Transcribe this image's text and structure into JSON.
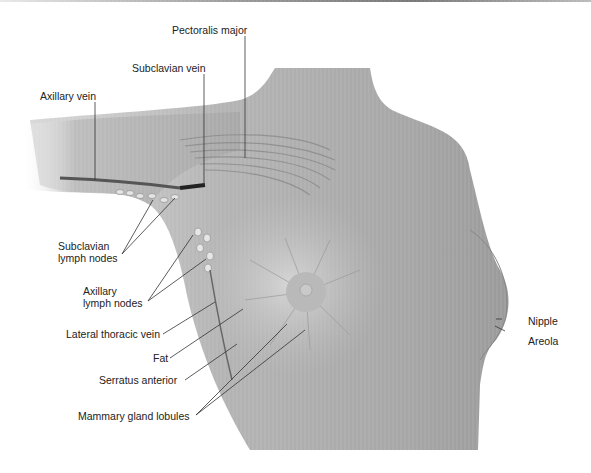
{
  "figure": {
    "labels": {
      "pectoralis_major": "Pectoralis major",
      "subclavian_vein": "Subclavian vein",
      "axillary_vein": "Axillary vein",
      "subclavian_lymph_nodes_1": "Subclavian",
      "subclavian_lymph_nodes_2": "lymph nodes",
      "axillary_lymph_nodes_1": "Axillary",
      "axillary_lymph_nodes_2": "lymph nodes",
      "lateral_thoracic_vein": "Lateral thoracic vein",
      "fat": "Fat",
      "serratus_anterior": "Serratus anterior",
      "mammary_gland_lobules": "Mammary gland lobules",
      "nipple": "Nipple",
      "areola": "Areola"
    },
    "colors": {
      "skin": "#a9a9a9",
      "skin_light": "#c8c8c8",
      "muscle": "#8f8f8f",
      "leader_line": "#333333",
      "text": "#222222",
      "background": "#ffffff"
    }
  }
}
